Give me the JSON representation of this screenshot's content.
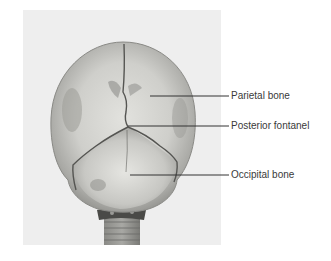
{
  "figure": {
    "colors": {
      "page_background": "#ffffff",
      "photo_background": "#eeeeee",
      "bone_light": "#dcdcd8",
      "bone_mid": "#b4b4b0",
      "bone_dark": "#7a7a76",
      "suture": "#555552",
      "leader_line": "#333333",
      "label_text": "#3a3a3a"
    },
    "labels": [
      {
        "text": "Parietal bone",
        "line_y": 96,
        "line_x_start": 150,
        "line_x_end": 229,
        "text_top": 90
      },
      {
        "text": "Posterior fontanel",
        "line_y": 126,
        "line_x_start": 128,
        "line_x_end": 229,
        "text_top": 120
      },
      {
        "text": "Occipital bone",
        "line_y": 175,
        "line_x_start": 130,
        "line_x_end": 229,
        "text_top": 169
      }
    ]
  }
}
